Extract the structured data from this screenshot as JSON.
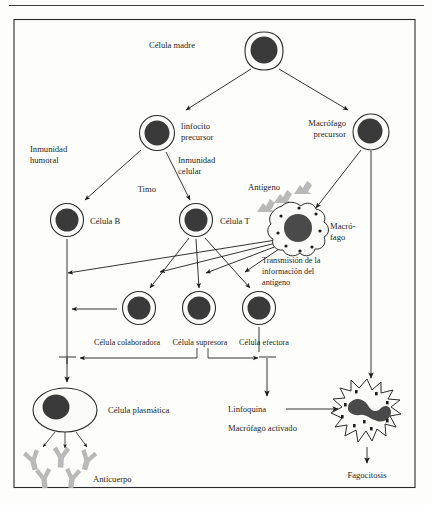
{
  "figure": {
    "language": "es"
  },
  "colors": {
    "frame": "#2a2a2a",
    "nucleus": "#3a3a3a",
    "cell_fill": "#fbfbf9",
    "antibody_gray": "#b9b9b9",
    "background": "#fdfdfb",
    "text": "#1d1d1d"
  },
  "labels": {
    "stem_cell": "Célula madre",
    "lymphocyte_precursor_line1": "linfocito",
    "lymphocyte_precursor_line2": "precursor",
    "macrophage_precursor_line1": "Macrófago",
    "macrophage_precursor_line2": "precursor",
    "humoral_immunity_line1": "Inmunidad",
    "humoral_immunity_line2": "humoral",
    "cellular_immunity_line1": "Inmunidad",
    "cellular_immunity_line2": "celular",
    "thymus": "Timo",
    "b_cell": "Célula B",
    "t_cell": "Célula T",
    "antigen": "Antígeno",
    "macrophage_line1": "Macró-",
    "macrophage_line2": "fago",
    "transmission_line1": "Transmisión de la",
    "transmission_line2": "información del",
    "transmission_line3": "antígeno",
    "helper_cell": "Célula colaboradora",
    "suppressor_cell": "Célula supresora",
    "effector_cell": "Célula efectora",
    "plasma_cell": "Célula plasmática",
    "antibody": "Anticuerpo",
    "lymphokine": "Linfoquina",
    "activated_macrophage": "Macrófago activado",
    "phagocytosis": "Fagocitosis"
  },
  "nodes": [
    {
      "id": "stem-cell",
      "label": "Célula madre",
      "type": "round-cell",
      "cx": 264,
      "cy": 51
    },
    {
      "id": "lymphocyte-precursor",
      "label": "linfocito precursor",
      "type": "round-cell",
      "cx": 157,
      "cy": 133
    },
    {
      "id": "macrophage-precursor",
      "label": "Macrófago precursor",
      "type": "round-cell",
      "cx": 371,
      "cy": 132
    },
    {
      "id": "b-cell",
      "label": "Célula B",
      "type": "round-cell",
      "cx": 67,
      "cy": 220
    },
    {
      "id": "t-cell",
      "label": "Célula T",
      "type": "round-cell",
      "cx": 196,
      "cy": 220
    },
    {
      "id": "macrophage",
      "label": "Macrófago",
      "type": "amoeboid",
      "cx": 299,
      "cy": 228
    },
    {
      "id": "helper-cell",
      "label": "Célula colaboradora",
      "type": "round-cell",
      "cx": 139,
      "cy": 308
    },
    {
      "id": "suppressor-cell",
      "label": "Célula supresora",
      "type": "round-cell",
      "cx": 199,
      "cy": 308
    },
    {
      "id": "effector-cell",
      "label": "Célula efectora",
      "type": "round-cell",
      "cx": 259,
      "cy": 308
    },
    {
      "id": "plasma-cell",
      "label": "Célula plasmática",
      "type": "oval-cell",
      "cx": 65,
      "cy": 410
    },
    {
      "id": "activated-macrophage",
      "label": "Macrófago activado",
      "type": "amoeboid",
      "cx": 367,
      "cy": 412
    }
  ],
  "edges": [
    {
      "from": "stem-cell",
      "to": "lymphocyte-precursor",
      "kind": "arrow"
    },
    {
      "from": "stem-cell",
      "to": "macrophage-precursor",
      "kind": "arrow"
    },
    {
      "from": "lymphocyte-precursor",
      "to": "b-cell",
      "kind": "arrow",
      "label": "Inmunidad humoral"
    },
    {
      "from": "lymphocyte-precursor",
      "to": "t-cell",
      "kind": "arrow",
      "label": "Inmunidad celular / Timo"
    },
    {
      "from": "macrophage-precursor",
      "to": "macrophage",
      "kind": "arrow"
    },
    {
      "from": "macrophage-precursor",
      "to": "effector-zone",
      "kind": "line"
    },
    {
      "from": "t-cell",
      "to": "helper-cell",
      "kind": "arrow"
    },
    {
      "from": "t-cell",
      "to": "suppressor-cell",
      "kind": "arrow"
    },
    {
      "from": "t-cell",
      "to": "effector-cell",
      "kind": "arrow"
    },
    {
      "from": "macrophage",
      "to": "b-cell-line",
      "kind": "arrow",
      "label": "Transmisión de la información del antígeno"
    },
    {
      "from": "macrophage",
      "to": "helper-cell",
      "kind": "arrow"
    },
    {
      "from": "macrophage",
      "to": "suppressor-cell",
      "kind": "arrow"
    },
    {
      "from": "macrophage",
      "to": "effector-cell",
      "kind": "arrow"
    },
    {
      "from": "helper-cell",
      "to": "b-cell-axis",
      "kind": "arrow-stimulate"
    },
    {
      "from": "suppressor-cell",
      "to": "effector-axis",
      "kind": "arrow-stimulate"
    },
    {
      "from": "b-cell-axis",
      "to": "plasma-cell",
      "kind": "arrow"
    },
    {
      "from": "effector-axis",
      "to": "lymphokine",
      "kind": "arrow"
    },
    {
      "from": "lymphokine",
      "to": "activated-macrophage",
      "kind": "arrow"
    },
    {
      "from": "activated-macrophage",
      "to": "phagocytosis",
      "kind": "arrow"
    },
    {
      "from": "plasma-cell",
      "to": "antibody",
      "kind": "arrow-triple"
    }
  ]
}
